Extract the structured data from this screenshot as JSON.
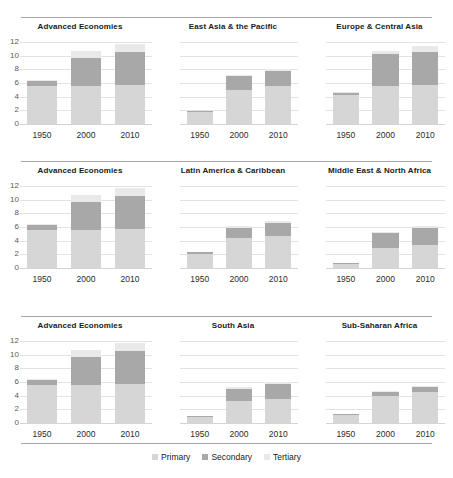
{
  "chart_data": {
    "type": "bar",
    "title": "",
    "subtitle": "",
    "xlabel": "",
    "ylabel": "",
    "ylim": [
      0,
      12
    ],
    "yticks": [
      "0",
      "2",
      "4",
      "6",
      "8",
      "10",
      "12"
    ],
    "categories": [
      "1950",
      "2000",
      "2010"
    ],
    "stacked": true,
    "grid": true,
    "legend_position": "bottom",
    "series_names": [
      "Primary",
      "Secondary",
      "Tertiary"
    ],
    "series_colors": [
      "#d6d6d6",
      "#a8a8a8",
      "#e9e9e9"
    ],
    "panels": [
      {
        "title": "Advanced Economies",
        "series": [
          {
            "name": "Primary",
            "values": [
              5.5,
              5.5,
              5.7
            ]
          },
          {
            "name": "Secondary",
            "values": [
              0.8,
              4.1,
              4.8
            ]
          },
          {
            "name": "Tertiary",
            "values": [
              0.1,
              1.1,
              1.2
            ]
          }
        ],
        "totals": [
          6.4,
          10.7,
          11.7
        ]
      },
      {
        "title": "East Asia & the Pacific",
        "series": [
          {
            "name": "Primary",
            "values": [
              1.7,
              5.0,
              5.5
            ]
          },
          {
            "name": "Secondary",
            "values": [
              0.2,
              2.0,
              2.3
            ]
          },
          {
            "name": "Tertiary",
            "values": [
              0.0,
              0.2,
              0.3
            ]
          }
        ],
        "totals": [
          1.9,
          7.2,
          8.1
        ]
      },
      {
        "title": "Europe & Central Asia",
        "series": [
          {
            "name": "Primary",
            "values": [
              4.2,
              5.6,
              5.7
            ]
          },
          {
            "name": "Secondary",
            "values": [
              0.4,
              4.6,
              4.8
            ]
          },
          {
            "name": "Tertiary",
            "values": [
              0.1,
              0.5,
              0.9
            ]
          }
        ],
        "totals": [
          4.7,
          10.7,
          11.4
        ]
      },
      {
        "title": "Advanced Economies",
        "series": [
          {
            "name": "Primary",
            "values": [
              5.5,
              5.5,
              5.7
            ]
          },
          {
            "name": "Secondary",
            "values": [
              0.8,
              4.1,
              4.8
            ]
          },
          {
            "name": "Tertiary",
            "values": [
              0.1,
              1.1,
              1.2
            ]
          }
        ],
        "totals": [
          6.4,
          10.7,
          11.7
        ]
      },
      {
        "title": "Latin America & Caribbean",
        "series": [
          {
            "name": "Primary",
            "values": [
              2.1,
              4.4,
              4.7
            ]
          },
          {
            "name": "Secondary",
            "values": [
              0.2,
              1.4,
              1.9
            ]
          },
          {
            "name": "Tertiary",
            "values": [
              0.05,
              0.3,
              0.3
            ]
          }
        ],
        "totals": [
          2.35,
          6.1,
          6.9
        ]
      },
      {
        "title": "Middle East & North Africa",
        "series": [
          {
            "name": "Primary",
            "values": [
              0.6,
              3.0,
              3.4
            ]
          },
          {
            "name": "Secondary",
            "values": [
              0.1,
              2.1,
              2.5
            ]
          },
          {
            "name": "Tertiary",
            "values": [
              0.02,
              0.2,
              0.3
            ]
          }
        ],
        "totals": [
          0.72,
          5.3,
          6.2
        ]
      },
      {
        "title": "Advanced Economies",
        "series": [
          {
            "name": "Primary",
            "values": [
              5.5,
              5.5,
              5.7
            ]
          },
          {
            "name": "Secondary",
            "values": [
              0.8,
              4.1,
              4.8
            ]
          },
          {
            "name": "Tertiary",
            "values": [
              0.1,
              1.1,
              1.2
            ]
          }
        ],
        "totals": [
          6.4,
          10.7,
          11.7
        ]
      },
      {
        "title": "South Asia",
        "series": [
          {
            "name": "Primary",
            "values": [
              0.9,
              3.2,
              3.5
            ]
          },
          {
            "name": "Secondary",
            "values": [
              0.1,
              1.8,
              2.2
            ]
          },
          {
            "name": "Tertiary",
            "values": [
              0.02,
              0.2,
              0.3
            ]
          }
        ],
        "totals": [
          1.02,
          5.2,
          6.0
        ]
      },
      {
        "title": "Sub-Saharan Africa",
        "series": [
          {
            "name": "Primary",
            "values": [
              1.2,
              4.0,
              4.5
            ]
          },
          {
            "name": "Secondary",
            "values": [
              0.1,
              0.6,
              0.8
            ]
          },
          {
            "name": "Tertiary",
            "values": [
              0.02,
              0.1,
              0.1
            ]
          }
        ],
        "totals": [
          1.32,
          4.7,
          5.4
        ]
      }
    ]
  },
  "legend": {
    "items": [
      {
        "label": "Primary",
        "color": "#d6d6d6"
      },
      {
        "label": "Secondary",
        "color": "#a8a8a8"
      },
      {
        "label": "Tertiary",
        "color": "#e9e9e9"
      }
    ]
  }
}
